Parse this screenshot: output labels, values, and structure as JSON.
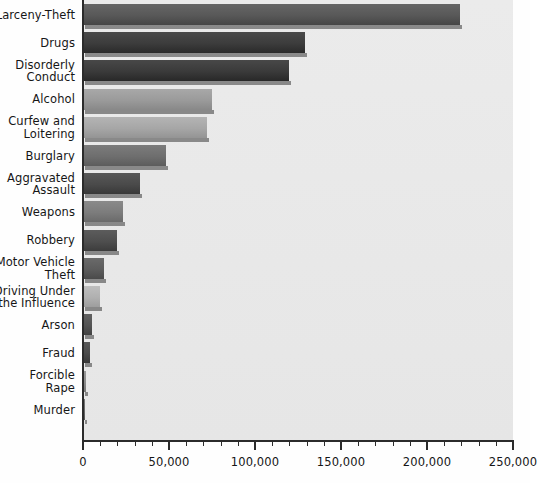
{
  "chart_data": {
    "type": "bar",
    "orientation": "horizontal",
    "title": "",
    "subtitle": "",
    "xlabel": "",
    "ylabel": "",
    "xlim": [
      0,
      250000
    ],
    "ylim": null,
    "grid": false,
    "legend": null,
    "categories": [
      "Larceny-Theft",
      "Drugs",
      "Disorderly Conduct",
      "Alcohol",
      "Curfew and Loitering",
      "Burglary",
      "Aggravated Assault",
      "Weapons",
      "Robbery",
      "Motor Vehicle Theft",
      "Driving Under the Influence",
      "Arson",
      "Fraud",
      "Forcible Rape",
      "Murder"
    ],
    "values": [
      219000,
      129000,
      120000,
      75000,
      72000,
      48000,
      33000,
      23000,
      20000,
      12000,
      10000,
      5000,
      4000,
      1700,
      400
    ],
    "xticks": [
      0,
      50000,
      100000,
      150000,
      200000,
      250000
    ],
    "xticklabels": [
      "0",
      "50,000",
      "100,000",
      "150,000",
      "200,000",
      "250,000"
    ],
    "minor_tick_interval": 10000,
    "bar_colors": [
      "#585858",
      "#3c3c3c",
      "#3a3a3a",
      "#9a9a9a",
      "#a6a6a6",
      "#6e6e6e",
      "#4a4a4a",
      "#7c7c7c",
      "#4e4e4e",
      "#5c5c5c",
      "#b0b0b0",
      "#545454",
      "#4a4a4a",
      "#8a8a8a",
      "#6a6a6a"
    ]
  },
  "axis": {
    "y_labels": [
      [
        "Larceny-Theft"
      ],
      [
        "Drugs"
      ],
      [
        "Disorderly",
        "Conduct"
      ],
      [
        "Alcohol"
      ],
      [
        "Curfew and",
        "Loitering"
      ],
      [
        "Burglary"
      ],
      [
        "Aggravated",
        "Assault"
      ],
      [
        "Weapons"
      ],
      [
        "Robbery"
      ],
      [
        "Motor Vehicle",
        "Theft"
      ],
      [
        "Driving Under",
        "the Influence"
      ],
      [
        "Arson"
      ],
      [
        "Fraud"
      ],
      [
        "Forcible",
        "Rape"
      ],
      [
        "Murder"
      ]
    ]
  },
  "colors": {
    "plot_background": "#e9e9e9",
    "page_background": "#fefefe",
    "axis": "#2b2b2b",
    "text": "#161616"
  }
}
